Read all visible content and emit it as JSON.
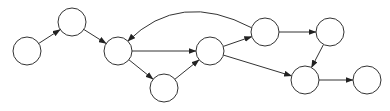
{
  "diagram": {
    "type": "directed-graph",
    "node_shape": "circle",
    "node_labels_visible": false,
    "stroke_color": "#333333",
    "background_color": "#ffffff",
    "nodes": [
      {
        "id": "n1"
      },
      {
        "id": "n2"
      },
      {
        "id": "n3"
      },
      {
        "id": "n4"
      },
      {
        "id": "n5"
      },
      {
        "id": "n6"
      },
      {
        "id": "n7"
      },
      {
        "id": "n8"
      },
      {
        "id": "n9"
      }
    ],
    "edges": [
      {
        "from": "n1",
        "to": "n2",
        "curved": false
      },
      {
        "from": "n2",
        "to": "n3",
        "curved": false
      },
      {
        "from": "n3",
        "to": "n5",
        "curved": false
      },
      {
        "from": "n3",
        "to": "n4",
        "curved": false
      },
      {
        "from": "n4",
        "to": "n5",
        "curved": false
      },
      {
        "from": "n5",
        "to": "n6",
        "curved": false
      },
      {
        "from": "n5",
        "to": "n8",
        "curved": false
      },
      {
        "from": "n6",
        "to": "n7",
        "curved": false
      },
      {
        "from": "n7",
        "to": "n8",
        "curved": false
      },
      {
        "from": "n8",
        "to": "n9",
        "curved": false
      },
      {
        "from": "n6",
        "to": "n3",
        "curved": true
      }
    ]
  }
}
